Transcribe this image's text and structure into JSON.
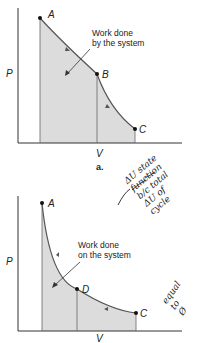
{
  "diagram_a": {
    "caption": "a.",
    "y_axis": "P",
    "x_axis": "V",
    "points": {
      "A": "A",
      "B": "B",
      "C": "C"
    },
    "annotation_line1": "Work done",
    "annotation_line2": "by the system"
  },
  "diagram_b": {
    "y_axis": "P",
    "x_axis": "V",
    "points": {
      "A": "A",
      "D": "D",
      "C": "C"
    },
    "annotation_line1": "Work done",
    "annotation_line2": "on the system"
  },
  "handwriting": {
    "lines": [
      "ΔU state",
      "function",
      "b/c total",
      "ΔU of",
      "cycle",
      "equal",
      "to",
      "Ø"
    ]
  },
  "colors": {
    "fill": "#d9d9d9",
    "curve": "#555555",
    "axis": "#333333"
  }
}
